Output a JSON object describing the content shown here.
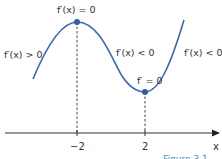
{
  "labels": {
    "left_increasing": "f′(x) > 0",
    "max_point": "f′(x) = 0",
    "middle_decreasing": "f′(x) < 0",
    "min_point": "f′ = 0",
    "right": "f′(x) < 0"
  },
  "axis": {
    "x_label": "x",
    "ticks": [
      "−2",
      "2"
    ]
  },
  "caption": "Figure 3.1",
  "colors": {
    "curve": "#3a67b5",
    "point": "#2f5ea8",
    "axis": "#333333",
    "caption": "#4a90c8"
  }
}
